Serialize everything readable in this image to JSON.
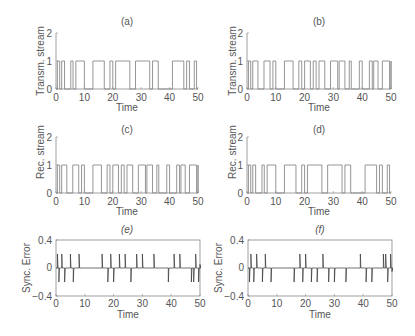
{
  "chart_data": [
    {
      "id": "a",
      "title": "(a)",
      "type": "line",
      "style": "step",
      "xlabel": "Time",
      "ylabel": "Transm. stream",
      "xlim": [
        0,
        50
      ],
      "ylim": [
        0,
        2
      ],
      "xticks": [
        0,
        10,
        20,
        30,
        40,
        50
      ],
      "yticks": [
        0,
        1,
        2
      ],
      "frame": "axes",
      "pulses": [
        [
          0.5,
          1.3
        ],
        [
          2,
          3
        ],
        [
          5.2,
          6
        ],
        [
          7,
          10
        ],
        [
          13,
          17
        ],
        [
          19,
          20
        ],
        [
          21,
          26
        ],
        [
          28,
          33
        ],
        [
          34,
          36
        ],
        [
          41,
          45
        ],
        [
          46,
          47
        ],
        [
          48.7,
          49.5
        ]
      ]
    },
    {
      "id": "b",
      "title": "(b)",
      "type": "line",
      "style": "step",
      "xlabel": "Time",
      "ylabel": "Transm. stream",
      "xlim": [
        0,
        50
      ],
      "ylim": [
        0,
        2
      ],
      "xticks": [
        0,
        10,
        20,
        30,
        40,
        50
      ],
      "yticks": [
        0,
        1,
        2
      ],
      "frame": "axes",
      "pulses": [
        [
          0.5,
          1.3
        ],
        [
          2,
          3.8
        ],
        [
          5.9,
          8
        ],
        [
          9,
          10
        ],
        [
          13,
          16
        ],
        [
          18,
          19
        ],
        [
          20,
          22
        ],
        [
          23,
          24
        ],
        [
          25,
          27
        ],
        [
          29,
          31.5
        ],
        [
          32,
          34
        ],
        [
          35.5,
          36.2
        ],
        [
          39,
          40
        ],
        [
          42.5,
          43.5
        ],
        [
          44,
          45.5
        ],
        [
          47,
          49.5
        ],
        [
          50,
          50.5
        ]
      ]
    },
    {
      "id": "c",
      "title": "(c)",
      "type": "line",
      "style": "step",
      "xlabel": "Time",
      "ylabel": "Rec. stream",
      "xlim": [
        0,
        50
      ],
      "ylim": [
        0,
        2
      ],
      "xticks": [
        0,
        10,
        20,
        30,
        40,
        50
      ],
      "yticks": [
        0,
        1,
        2
      ],
      "frame": "axes",
      "pulses": [
        [
          0.5,
          1.3
        ],
        [
          2,
          3.8
        ],
        [
          5.9,
          8
        ],
        [
          9,
          10
        ],
        [
          13,
          16
        ],
        [
          18,
          19
        ],
        [
          20,
          22
        ],
        [
          23,
          24
        ],
        [
          25,
          27
        ],
        [
          29,
          31.5
        ],
        [
          32,
          34
        ],
        [
          35.5,
          36.2
        ],
        [
          39,
          40
        ],
        [
          42.5,
          43.5
        ],
        [
          44,
          45.5
        ],
        [
          47,
          49.5
        ],
        [
          50,
          50.5
        ]
      ]
    },
    {
      "id": "d",
      "title": "(d)",
      "type": "line",
      "style": "step",
      "xlabel": "Time",
      "ylabel": "Rec. stream",
      "xlim": [
        0,
        50
      ],
      "ylim": [
        0,
        2
      ],
      "xticks": [
        0,
        10,
        20,
        30,
        40,
        50
      ],
      "yticks": [
        0,
        1,
        2
      ],
      "frame": "axes",
      "pulses": [
        [
          0.5,
          1.3
        ],
        [
          2,
          3
        ],
        [
          5.2,
          6
        ],
        [
          7,
          10
        ],
        [
          13,
          17
        ],
        [
          19,
          20
        ],
        [
          21,
          26
        ],
        [
          28,
          33
        ],
        [
          34,
          36
        ],
        [
          41,
          45
        ],
        [
          46,
          47
        ],
        [
          48.7,
          49.5
        ]
      ]
    },
    {
      "id": "e",
      "title": "(e)",
      "type": "line",
      "style": "spikes",
      "xlabel": "Time",
      "ylabel": "Sync. Error",
      "xlim": [
        0,
        50
      ],
      "ylim": [
        -0.4,
        0.4
      ],
      "xticks": [
        0,
        10,
        20,
        30,
        40,
        50
      ],
      "yticks": [
        -0.4,
        0,
        0.4
      ],
      "yticklabels": [
        "−0.4",
        "0",
        "0.4"
      ],
      "frame": "box",
      "spikes": [
        [
          0.5,
          0.2
        ],
        [
          1,
          -0.2
        ],
        [
          2,
          0.2
        ],
        [
          3,
          -0.2
        ],
        [
          5,
          0.2
        ],
        [
          6,
          -0.2
        ],
        [
          8,
          0.2
        ],
        [
          16,
          0.2
        ],
        [
          18,
          -0.2
        ],
        [
          19,
          0.2
        ],
        [
          20,
          -0.2
        ],
        [
          22,
          0.2
        ],
        [
          24,
          0.2
        ],
        [
          26,
          -0.2
        ],
        [
          28,
          0.2
        ],
        [
          30,
          0.2
        ],
        [
          34,
          0.2
        ],
        [
          39,
          -0.2
        ],
        [
          41,
          0.2
        ],
        [
          43,
          0.2
        ],
        [
          47,
          -0.2
        ],
        [
          47.8,
          -0.2
        ],
        [
          48.5,
          0.2
        ],
        [
          49.5,
          -0.2
        ],
        [
          50,
          0.05
        ]
      ]
    },
    {
      "id": "f",
      "title": "(f)",
      "type": "line",
      "style": "spikes",
      "xlabel": "Time",
      "ylabel": "Sync. Error",
      "xlim": [
        0,
        50
      ],
      "ylim": [
        -0.4,
        0.4
      ],
      "xticks": [
        0,
        10,
        20,
        30,
        40,
        50
      ],
      "yticks": [
        -0.4,
        0,
        0.4
      ],
      "yticklabels": [
        "−0.4",
        "0",
        "0.4"
      ],
      "frame": "box",
      "spikes": [
        [
          0.5,
          -0.2
        ],
        [
          1,
          0.2
        ],
        [
          2,
          -0.2
        ],
        [
          3,
          0.2
        ],
        [
          5,
          -0.2
        ],
        [
          6,
          0.2
        ],
        [
          8,
          -0.2
        ],
        [
          16,
          -0.2
        ],
        [
          18,
          0.2
        ],
        [
          19,
          -0.2
        ],
        [
          20,
          0.2
        ],
        [
          22,
          -0.2
        ],
        [
          24,
          -0.2
        ],
        [
          26,
          0.2
        ],
        [
          28,
          -0.2
        ],
        [
          30,
          -0.2
        ],
        [
          34,
          -0.2
        ],
        [
          39,
          0.2
        ],
        [
          41,
          -0.2
        ],
        [
          43,
          -0.2
        ],
        [
          47,
          0.2
        ],
        [
          47.8,
          0.2
        ],
        [
          48.5,
          -0.2
        ],
        [
          49.5,
          0.2
        ],
        [
          50,
          -0.05
        ]
      ]
    }
  ],
  "panels": {
    "a": {
      "title": "(a)",
      "ylabel": "Transm. stream",
      "xlabel": "Time",
      "yt0": "0",
      "yt1": "1",
      "yt2": "2",
      "xt0": "0",
      "xt1": "10",
      "xt2": "20",
      "xt3": "30",
      "xt4": "40",
      "xt5": "50"
    },
    "b": {
      "title": "(b)",
      "ylabel": "Transm. stream",
      "xlabel": "Time",
      "yt0": "0",
      "yt1": "1",
      "yt2": "2",
      "xt0": "0",
      "xt1": "10",
      "xt2": "20",
      "xt3": "30",
      "xt4": "40",
      "xt5": "50"
    },
    "c": {
      "title": "(c)",
      "ylabel": "Rec. stream",
      "xlabel": "Time",
      "yt0": "0",
      "yt1": "1",
      "yt2": "2",
      "xt0": "0",
      "xt1": "10",
      "xt2": "20",
      "xt3": "30",
      "xt4": "40",
      "xt5": "50"
    },
    "d": {
      "title": "(d)",
      "ylabel": "Rec. stream",
      "xlabel": "Time",
      "yt0": "0",
      "yt1": "1",
      "yt2": "2",
      "xt0": "0",
      "xt1": "10",
      "xt2": "20",
      "xt3": "30",
      "xt4": "40",
      "xt5": "50"
    },
    "e": {
      "title": "(e)",
      "ylabel": "Sync. Error",
      "xlabel": "Time",
      "yt0": "−0.4",
      "yt1": "0",
      "yt2": "0.4",
      "xt0": "0",
      "xt1": "10",
      "xt2": "20",
      "xt3": "30",
      "xt4": "40",
      "xt5": "50"
    },
    "f": {
      "title": "(f)",
      "ylabel": "Sync. Error",
      "xlabel": "Time",
      "yt0": "−0.4",
      "yt1": "0",
      "yt2": "0.4",
      "xt0": "0",
      "xt1": "10",
      "xt2": "20",
      "xt3": "30",
      "xt4": "40",
      "xt5": "50"
    }
  },
  "colors": {
    "line": "#8a8a8a",
    "error_line": "#333333",
    "axis": "#888888",
    "text": "#555555"
  }
}
